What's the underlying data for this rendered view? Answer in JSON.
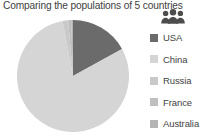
{
  "chart_data": {
    "type": "pie",
    "title": "Comparing the populations of 5 countries",
    "categories": [
      "USA",
      "China",
      "Russia",
      "France",
      "Australia"
    ],
    "values": [
      17.0,
      80.0,
      1.6,
      0.9,
      0.5
    ],
    "units": "percent of combined population",
    "colors": [
      "#6b6b6b",
      "#d5d5d5",
      "#c9c9c9",
      "#bfbfbf",
      "#b4b4b4"
    ],
    "slices": [
      {
        "label": "USA",
        "value": 17.0,
        "color": "#6b6b6b",
        "start_deg": 0.0,
        "end_deg": 61.2
      },
      {
        "label": "China",
        "value": 80.0,
        "color": "#d5d5d5",
        "start_deg": 61.2,
        "end_deg": 349.2
      },
      {
        "label": "Russia",
        "value": 1.6,
        "color": "#c9c9c9",
        "start_deg": 349.2,
        "end_deg": 354.96
      },
      {
        "label": "France",
        "value": 0.9,
        "color": "#bfbfbf",
        "start_deg": 354.96,
        "end_deg": 358.2
      },
      {
        "label": "Australia",
        "value": 0.5,
        "color": "#b4b4b4",
        "start_deg": 358.2,
        "end_deg": 360.0
      }
    ],
    "legend_position": "right",
    "grid": false,
    "xlabel": "",
    "ylabel": "",
    "start_angle_deg": 0,
    "direction": "clockwise"
  },
  "legend": {
    "items": [
      {
        "label": "USA",
        "color": "#6b6b6b"
      },
      {
        "label": "China",
        "color": "#d5d5d5"
      },
      {
        "label": "Russia",
        "color": "#c9c9c9"
      },
      {
        "label": "France",
        "color": "#bfbfbf"
      },
      {
        "label": "Australia",
        "color": "#b4b4b4"
      }
    ]
  },
  "icons": {
    "people": "people-group-icon",
    "people_color": "#4d4d4d"
  },
  "canvas": {
    "background": "#ffffff",
    "pie_center_x": 59,
    "pie_center_y": 57,
    "pie_radius": 56
  }
}
